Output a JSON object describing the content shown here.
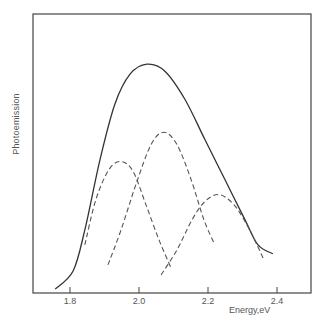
{
  "chart_data": {
    "type": "line",
    "title": "",
    "xlabel": "Energy,eV",
    "ylabel": "Photoemission",
    "xlim": [
      1.75,
      2.52
    ],
    "ylim": [
      0,
      1
    ],
    "grid": false,
    "legend": null,
    "xticks": [
      1.8,
      2.0,
      2.2,
      2.4
    ],
    "xtick_labels": [
      "1.8",
      "2.0",
      "2.2",
      "2.4"
    ],
    "yticks": [],
    "series": [
      {
        "name": "total",
        "style": "solid",
        "x": [
          1.757,
          1.809,
          1.843,
          1.887,
          1.93,
          1.974,
          2.023,
          2.075,
          2.133,
          2.191,
          2.249,
          2.307,
          2.345,
          2.388
        ],
        "y": [
          0.014,
          0.079,
          0.227,
          0.48,
          0.679,
          0.787,
          0.823,
          0.798,
          0.697,
          0.552,
          0.408,
          0.264,
          0.173,
          0.141
        ]
      },
      {
        "name": "component-1",
        "style": "dashed",
        "x": [
          1.843,
          1.875,
          1.913,
          1.948,
          1.983,
          2.02,
          2.058,
          2.093
        ],
        "y": [
          0.173,
          0.336,
          0.444,
          0.473,
          0.437,
          0.318,
          0.191,
          0.09
        ]
      },
      {
        "name": "component-2",
        "style": "dashed",
        "x": [
          1.91,
          1.948,
          1.991,
          2.035,
          2.072,
          2.11,
          2.151,
          2.188,
          2.217
        ],
        "y": [
          0.101,
          0.227,
          0.39,
          0.534,
          0.578,
          0.534,
          0.408,
          0.264,
          0.181
        ]
      },
      {
        "name": "component-3",
        "style": "dashed",
        "x": [
          2.064,
          2.11,
          2.154,
          2.191,
          2.232,
          2.275,
          2.313,
          2.342,
          2.362
        ],
        "y": [
          0.065,
          0.155,
          0.264,
          0.329,
          0.354,
          0.318,
          0.245,
          0.173,
          0.119
        ]
      }
    ]
  }
}
